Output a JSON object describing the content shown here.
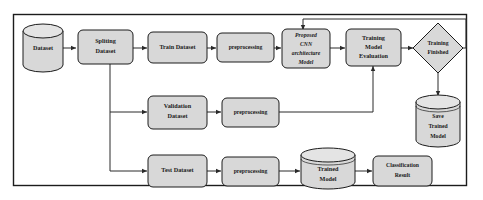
{
  "diagram": {
    "type": "flowchart",
    "frame": {
      "stroke": "#1c1c1c"
    },
    "colors": {
      "shape_fill": "#d8d8d8",
      "shape_stroke": "#1c1c1c",
      "cylinder_top": "#e4e4e4",
      "connector": "#2a2a2a",
      "background": "#ffffff",
      "text": "#1a1a1a"
    },
    "nodes": {
      "dataset": {
        "label": "Dataset",
        "shape": "cylinder"
      },
      "spliting_dataset": {
        "label_line1": "Spliting",
        "label_line2": "Dataset",
        "shape": "rounded-rect"
      },
      "train_dataset": {
        "label": "Train Dataset",
        "shape": "rounded-rect"
      },
      "preprocessing_train": {
        "label": "preprocessing",
        "shape": "rounded-rect"
      },
      "proposed_cnn": {
        "label_line1": "Proposed",
        "label_line2": "CNN",
        "label_line3": "architecture",
        "label_line4": "Model",
        "shape": "rounded-rect"
      },
      "training_model_evaluation": {
        "label_line1": "Training",
        "label_line2": "Model",
        "label_line3": "Evaluation",
        "shape": "rounded-rect"
      },
      "training_finished": {
        "label_line1": "Training",
        "label_line2": "Finished",
        "shape": "diamond"
      },
      "save_trained_model": {
        "label_line1": "Save",
        "label_line2": "Trained",
        "label_line3": "Model",
        "shape": "cylinder"
      },
      "validation_dataset": {
        "label_line1": "Validation",
        "label_line2": "Dataset",
        "shape": "rounded-rect"
      },
      "preprocessing_validation": {
        "label": "preprocessing",
        "shape": "rounded-rect"
      },
      "test_dataset": {
        "label": "Test Dataset",
        "shape": "rounded-rect"
      },
      "preprocessing_test": {
        "label": "preprocessing",
        "shape": "rounded-rect"
      },
      "trained_model": {
        "label_line1": "Trained",
        "label_line2": "Model",
        "shape": "cylinder"
      },
      "classification_result": {
        "label_line1": "Classification",
        "label_line2": "Result",
        "shape": "rounded-rect"
      }
    },
    "edges": [
      {
        "from": "dataset",
        "to": "spliting_dataset"
      },
      {
        "from": "spliting_dataset",
        "to": "train_dataset"
      },
      {
        "from": "spliting_dataset",
        "to": "validation_dataset"
      },
      {
        "from": "spliting_dataset",
        "to": "test_dataset"
      },
      {
        "from": "train_dataset",
        "to": "preprocessing_train"
      },
      {
        "from": "preprocessing_train",
        "to": "proposed_cnn"
      },
      {
        "from": "proposed_cnn",
        "to": "training_model_evaluation"
      },
      {
        "from": "training_model_evaluation",
        "to": "training_finished"
      },
      {
        "from": "training_finished",
        "to": "save_trained_model"
      },
      {
        "from": "training_finished",
        "to": "proposed_cnn",
        "style": "feedback-loop"
      },
      {
        "from": "validation_dataset",
        "to": "preprocessing_validation"
      },
      {
        "from": "preprocessing_validation",
        "to": "training_model_evaluation"
      },
      {
        "from": "test_dataset",
        "to": "preprocessing_test"
      },
      {
        "from": "preprocessing_test",
        "to": "trained_model"
      },
      {
        "from": "trained_model",
        "to": "classification_result"
      }
    ]
  }
}
